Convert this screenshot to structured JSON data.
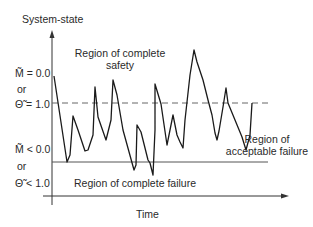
{
  "diagram": {
    "y_axis_label": "System-state",
    "x_axis_label": "Time",
    "regions": {
      "complete_safety_line1": "Region of complete",
      "complete_safety_line2": "safety",
      "acceptable_failure_line1": "Region of",
      "acceptable_failure_line2": "acceptable failure",
      "complete_failure": "Region of complete failure"
    },
    "thresholds": {
      "upper_m": "M̃ = 0.0",
      "upper_or": "or",
      "upper_theta": "Θ̃ = 1.0",
      "lower_m": "M̃ < 0.0",
      "lower_or": "or",
      "lower_theta": "Θ̃ < 1.0"
    },
    "colors": {
      "line": "#1a1a1a",
      "axis": "#333333",
      "dashed": "#666666",
      "failure_line": "#555555"
    }
  }
}
